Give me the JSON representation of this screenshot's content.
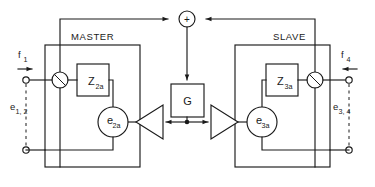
{
  "diagram": {
    "type": "block-diagram",
    "background_color": "#ffffff",
    "line_color": "#1a1a1a"
  },
  "sections": {
    "master": {
      "label": "MASTER"
    },
    "slave": {
      "label": "SLAVE"
    }
  },
  "blocks": {
    "impedance_master": {
      "symbol": "Z",
      "subscript": "2a"
    },
    "impedance_slave": {
      "symbol": "Z",
      "subscript": "3a"
    },
    "gain": {
      "label": "G"
    },
    "source_master": {
      "symbol": "e",
      "subscript": "2a"
    },
    "source_slave": {
      "symbol": "e",
      "subscript": "3a"
    }
  },
  "nodes": {
    "summing_junction": {
      "sign": "+"
    }
  },
  "ports": {
    "flow_in_left": {
      "symbol": "f",
      "subscript": "1"
    },
    "effort_left": {
      "symbol": "e",
      "subscript": "1, 2"
    },
    "flow_in_right": {
      "symbol": "f",
      "subscript": "4"
    },
    "effort_right": {
      "symbol": "e",
      "subscript": "3, 4"
    }
  }
}
